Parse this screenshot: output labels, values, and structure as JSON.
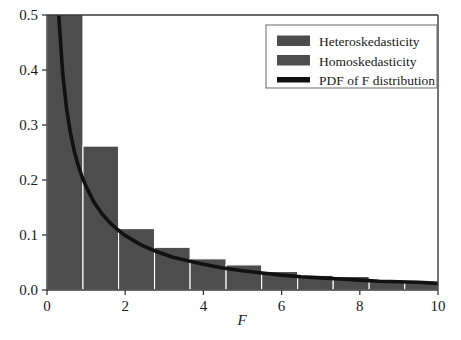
{
  "chart_data": {
    "type": "bar",
    "title": "",
    "subtitle": "",
    "xlabel": "F",
    "ylabel": "",
    "xlim": [
      0,
      10
    ],
    "ylim": [
      0.0,
      0.5
    ],
    "xticks": [
      0,
      2,
      4,
      6,
      8,
      10
    ],
    "xtick_labels": [
      "0",
      "2",
      "4",
      "6",
      "8",
      "10"
    ],
    "yticks": [
      0.0,
      0.1,
      0.2,
      0.3,
      0.4,
      0.5
    ],
    "ytick_labels": [
      "0.0",
      "0.1",
      "0.2",
      "0.3",
      "0.4",
      "0.5"
    ],
    "grid": false,
    "legend_position": "top-right",
    "bar_color": "#4d4d4d",
    "curve_color": "#111111",
    "axis_color": "#3a3a3a",
    "background_color": "#ffffff",
    "note": "Overlaid histograms of the F statistic under heteroskedasticity and homoskedasticity, compared with the theoretical F probability density function. The leading bin exceeds the top of the axis and is clipped at 0.5.",
    "series": [
      {
        "name": "Heteroskedasticity",
        "type": "histogram",
        "color": "#4d4d4d",
        "bin_edges": [
          0.0,
          0.82,
          1.64,
          2.73,
          3.55,
          4.37,
          5.19,
          6.01,
          6.83,
          7.65,
          8.47,
          9.29,
          10.0
        ],
        "values": [
          0.5,
          0.168,
          0.108,
          0.074,
          0.053,
          0.042,
          0.03,
          0.023,
          0.021,
          0.014,
          0.011,
          0.008
        ]
      },
      {
        "name": "Homoskedasticity",
        "type": "histogram",
        "color": "#4d4d4d",
        "bin_edges": [
          0.0,
          0.92,
          1.83,
          2.75,
          3.66,
          4.58,
          5.49,
          6.41,
          7.32,
          8.24,
          9.15,
          10.0
        ],
        "values": [
          0.5,
          0.258,
          0.108,
          0.074,
          0.053,
          0.042,
          0.03,
          0.023,
          0.021,
          0.014,
          0.01
        ]
      },
      {
        "name": "PDF of F distribution",
        "type": "line",
        "color": "#111111",
        "x": [
          0.12,
          0.2,
          0.3,
          0.4,
          0.5,
          0.6,
          0.7,
          0.8,
          0.9,
          1.0,
          1.2,
          1.4,
          1.6,
          1.8,
          2.0,
          2.4,
          2.8,
          3.2,
          3.6,
          4.0,
          4.5,
          5.0,
          5.5,
          6.0,
          6.5,
          7.0,
          7.5,
          8.0,
          8.5,
          9.0,
          9.5,
          10.0
        ],
        "y": [
          0.95,
          0.7,
          0.5,
          0.395,
          0.33,
          0.285,
          0.252,
          0.226,
          0.205,
          0.188,
          0.16,
          0.139,
          0.123,
          0.11,
          0.099,
          0.082,
          0.07,
          0.06,
          0.053,
          0.047,
          0.04,
          0.035,
          0.031,
          0.027,
          0.024,
          0.022,
          0.02,
          0.018,
          0.016,
          0.015,
          0.014,
          0.012
        ]
      }
    ]
  },
  "legend": {
    "items": [
      {
        "label": "Heteroskedasticity",
        "swatch": "bar",
        "color": "#4d4d4d"
      },
      {
        "label": "Homoskedasticity",
        "swatch": "bar",
        "color": "#4d4d4d"
      },
      {
        "label": "PDF of F distribution",
        "swatch": "line",
        "color": "#111111"
      }
    ]
  },
  "axes": {
    "x_title": "F",
    "x_tick_labels": [
      "0",
      "2",
      "4",
      "6",
      "8",
      "10"
    ],
    "y_tick_labels": [
      "0.0",
      "0.1",
      "0.2",
      "0.3",
      "0.4",
      "0.5"
    ]
  }
}
